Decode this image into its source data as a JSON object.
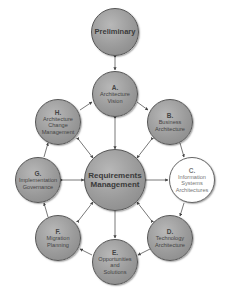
{
  "diagram": {
    "center": {
      "label": "Requirements\nManagement"
    },
    "preliminary": {
      "label": "Preliminary"
    },
    "phases": [
      {
        "letter": "A.",
        "label": "Architecture\nVision"
      },
      {
        "letter": "B.",
        "label": "Business\nArchitecture"
      },
      {
        "letter": "C.",
        "label": "Information\nSystems\nArchitectures",
        "highlighted": true
      },
      {
        "letter": "D.",
        "label": "Technology\nArchitecture"
      },
      {
        "letter": "E.",
        "label": "Opportunities\nand\nSolutions"
      },
      {
        "letter": "F.",
        "label": "Migration\nPlanning"
      },
      {
        "letter": "G.",
        "label": "Implementation\nGovernance"
      },
      {
        "letter": "H.",
        "label": "Architecture\nChange\nManagement"
      }
    ],
    "colors": {
      "node_fill": "#9a9a9a",
      "node_border": "#555555",
      "highlight_fill": "#ffffff",
      "arrow": "#444444"
    }
  }
}
